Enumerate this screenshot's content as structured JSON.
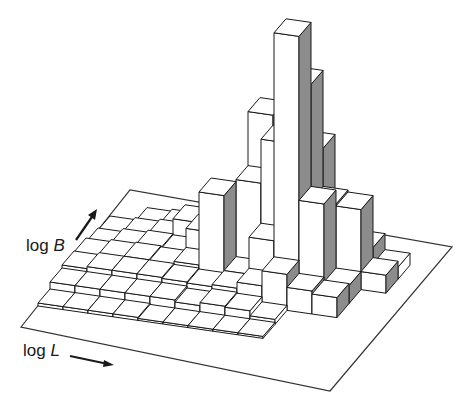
{
  "chart_data": {
    "type": "bar3d",
    "title": "",
    "xlabel": "log L",
    "ylabel": "log B",
    "zlabel": "",
    "x_axis_name": "log",
    "x_axis_var": "L",
    "y_axis_name": "log",
    "y_axis_var": "B",
    "grid": false,
    "legend": null,
    "rows_note": "heights[j][i]: j = log B bin (front to back), i = log L bin (left to right); units ~ relative counts (approximate, read from bar heights)",
    "heights": [
      [
        0.3,
        0.3,
        0.3,
        0.3,
        0.2,
        0.2,
        0.2,
        0.2,
        0.2,
        0,
        0,
        0
      ],
      [
        1.0,
        1.0,
        1.0,
        1.0,
        1.0,
        0.8,
        1.1,
        1.0,
        0.5,
        0,
        0,
        0
      ],
      [
        1.3,
        1.5,
        1.5,
        1.5,
        1.4,
        1.3,
        1.5,
        2.1,
        3.6,
        2.3,
        2.0,
        0
      ],
      [
        1.2,
        1.4,
        1.5,
        1.4,
        1.7,
        9.0,
        1.5,
        5.2,
        26.0,
        9.6,
        1.8,
        0
      ],
      [
        0.8,
        1.1,
        1.3,
        1.2,
        3.6,
        5.4,
        9.2,
        13.6,
        19.8,
        8.2,
        8.0,
        1.8
      ],
      [
        0.6,
        0.8,
        1.0,
        2.8,
        2.0,
        3.4,
        14.6,
        6.5,
        12.0,
        2.6,
        2.8,
        1.2
      ],
      [
        0,
        0.4,
        0.6,
        1.0,
        1.0,
        3.0,
        3.8,
        2.8,
        1.8,
        0.8,
        0,
        0
      ],
      [
        0,
        0,
        0,
        0,
        0,
        0,
        0,
        0.3,
        0.4,
        0,
        0,
        0
      ]
    ],
    "scale_px_per_unit": 10,
    "colors": {
      "top": "#ffffff",
      "front": "#ffffff",
      "side": "#8c8c8c",
      "edge": "#1a1a1a",
      "plane": "#333333"
    }
  },
  "labels": {
    "b_axis": {
      "text": "log ",
      "var": "B"
    },
    "l_axis": {
      "text": "log ",
      "var": "L"
    }
  }
}
